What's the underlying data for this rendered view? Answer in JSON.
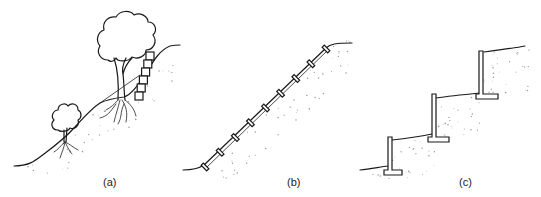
{
  "figure": {
    "panels": [
      {
        "id": "a",
        "label": "(a)",
        "description": "Slope with trees, shrub, roots and a small stacked block retaining wall"
      },
      {
        "id": "b",
        "label": "(b)",
        "description": "Uniform slope with anchored elements along the surface"
      },
      {
        "id": "c",
        "label": "(c)",
        "description": "Terraced slope with three cantilever retaining walls"
      }
    ],
    "colors": {
      "ink": "#1a1a1a",
      "stipple": "#9a9a9a",
      "background": "#ffffff"
    }
  }
}
